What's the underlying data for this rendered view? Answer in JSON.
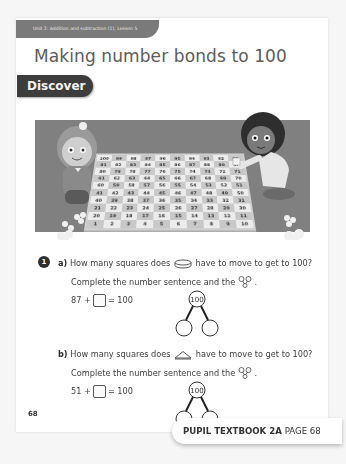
{
  "header": {
    "unit_strip": "Unit 2: Addition and subtraction (1), Lesson 5",
    "title": "Making number bonds to 100",
    "section_label": "Discover"
  },
  "illustration": {
    "description": "Two children playing a 1-100 snakes and ladders board game on a rug",
    "board_rows": [
      [
        100,
        99,
        98,
        97,
        96,
        95,
        94,
        93,
        92,
        91
      ],
      [
        81,
        82,
        83,
        84,
        85,
        86,
        87,
        88,
        89,
        90
      ],
      [
        80,
        79,
        78,
        77,
        76,
        75,
        74,
        73,
        72,
        71
      ],
      [
        61,
        62,
        63,
        64,
        65,
        66,
        67,
        68,
        69,
        70
      ],
      [
        60,
        59,
        58,
        57,
        56,
        55,
        54,
        53,
        52,
        51
      ],
      [
        41,
        42,
        43,
        44,
        45,
        46,
        47,
        48,
        49,
        50
      ],
      [
        40,
        39,
        38,
        37,
        36,
        35,
        34,
        33,
        32,
        31
      ],
      [
        21,
        22,
        23,
        24,
        25,
        26,
        27,
        28,
        29,
        30
      ],
      [
        20,
        19,
        18,
        17,
        16,
        15,
        14,
        13,
        12,
        11
      ],
      [
        1,
        2,
        3,
        4,
        5,
        6,
        7,
        8,
        9,
        10
      ]
    ],
    "counters": [
      {
        "shape": "cylinder-counter-icon",
        "on_square": 87
      },
      {
        "shape": "triangle-counter-icon",
        "on_square": 51
      }
    ]
  },
  "question": {
    "number": "1",
    "parts": [
      {
        "label": "a)",
        "line1_before": "How many squares does",
        "line1_icon": "cylinder-counter-icon",
        "line1_after": "have to move to get to 100?",
        "line2": "Complete the number sentence and the",
        "line2_icon": "part-whole-model-icon",
        "line2_end": ".",
        "sentence_left": "87 +",
        "sentence_right": "= 100",
        "whole": "100"
      },
      {
        "label": "b)",
        "line1_before": "How many squares does",
        "line1_icon": "triangle-counter-icon",
        "line1_after": "have to move to get to 100?",
        "line2": "Complete the number sentence and the",
        "line2_icon": "part-whole-model-icon",
        "line2_end": ".",
        "sentence_left": "51 +",
        "sentence_right": "= 100",
        "whole": "100"
      }
    ]
  },
  "footer": {
    "page_number": "68",
    "book_label": "PUPIL TEXTBOOK 2A",
    "page_label": "PAGE 68"
  }
}
